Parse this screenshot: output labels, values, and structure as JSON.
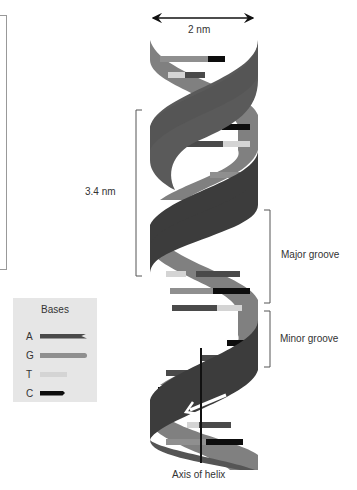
{
  "diagram": {
    "title_measure": "2 nm",
    "pitch_label": "3.4 nm",
    "major_groove_label": "Major groove",
    "minor_groove_label": "Minor groove",
    "axis_label": "Axis of helix"
  },
  "legend": {
    "title": "Bases",
    "items": [
      {
        "letter": "A",
        "color": "#4a4a4a",
        "width": 47
      },
      {
        "letter": "G",
        "color": "#8f8f8f",
        "width": 47
      },
      {
        "letter": "T",
        "color": "#d4d4d4",
        "width": 27
      },
      {
        "letter": "C",
        "color": "#0d0d0d",
        "width": 25
      }
    ]
  },
  "colors": {
    "strand_dark": "#3c3c3c",
    "strand_light": "#7a7a7a",
    "base_A": "#4a4a4a",
    "base_G": "#8f8f8f",
    "base_T": "#d4d4d4",
    "base_C": "#0d0d0d",
    "legend_bg": "#e6e6e6"
  }
}
